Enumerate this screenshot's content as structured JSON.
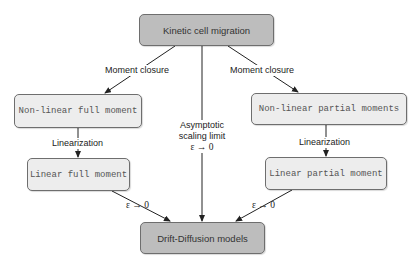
{
  "diagram": {
    "nodes": {
      "top": "Kinetic cell migration",
      "nonlinear_full": "Non-linear full moment",
      "nonlinear_partial": "Non-linear partial moments",
      "linear_full": "Linear full moment",
      "linear_partial": "Linear partial moment",
      "bottom": "Drift-Diffusion models"
    },
    "edge_labels": {
      "moment_closure_left": "Moment closure",
      "moment_closure_right": "Moment closure",
      "asymptotic_1": "Asymptotic",
      "asymptotic_2": "scaling limit",
      "asymptotic_3": "ε → 0",
      "linearization_left": "Linearization",
      "linearization_right": "Linearization",
      "eps_left": "ε → 0",
      "eps_right": "ε → 0"
    },
    "colors": {
      "dark_box": "#bdbdbd",
      "light_box": "#ededed",
      "edge": "#222222"
    }
  }
}
